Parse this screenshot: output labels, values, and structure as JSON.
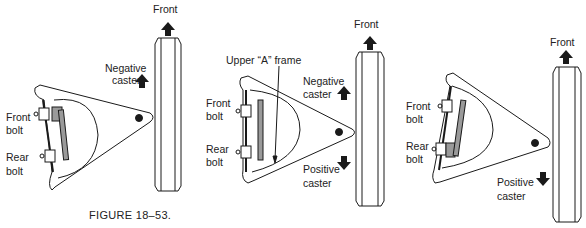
{
  "figure": {
    "caption": "FIGURE 18–53.",
    "panels": [
      {
        "id": "left",
        "labels": {
          "front": "Front",
          "negative_caster_1": "Negative",
          "negative_caster_2": "caster",
          "front_bolt_1": "Front",
          "front_bolt_2": "bolt",
          "rear_bolt_1": "Rear",
          "rear_bolt_2": "bolt"
        },
        "arrows": [
          "front-up",
          "negative-caster-up"
        ]
      },
      {
        "id": "center",
        "labels": {
          "upper_a_frame": "Upper “A” frame",
          "front": "Front",
          "negative_caster_1": "Negative",
          "negative_caster_2": "caster",
          "positive_caster_1": "Positive",
          "positive_caster_2": "caster",
          "front_bolt_1": "Front",
          "front_bolt_2": "bolt",
          "rear_bolt_1": "Rear",
          "rear_bolt_2": "bolt"
        },
        "arrows": [
          "front-up",
          "negative-caster-up",
          "positive-caster-down"
        ]
      },
      {
        "id": "right",
        "labels": {
          "front": "Front",
          "positive_caster_1": "Positive",
          "positive_caster_2": "caster",
          "front_bolt_1": "Front",
          "front_bolt_2": "bolt",
          "rear_bolt_1": "Rear",
          "rear_bolt_2": "bolt"
        },
        "arrows": [
          "front-up",
          "positive-caster-down"
        ]
      }
    ]
  },
  "colors": {
    "ink": "#1a1a1a",
    "shim": "#9a9a9a",
    "background": "#ffffff"
  }
}
